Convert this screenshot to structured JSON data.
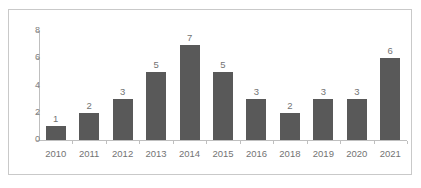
{
  "chart_data": {
    "type": "bar",
    "title": "",
    "subtitle": "",
    "xlabel": "",
    "ylabel": "",
    "categories": [
      "2010",
      "2011",
      "2012",
      "2013",
      "2014",
      "2015",
      "2016",
      "2018",
      "2019",
      "2020",
      "2021"
    ],
    "values": [
      1,
      2,
      3,
      5,
      7,
      5,
      3,
      2,
      3,
      3,
      6
    ],
    "data_labels": [
      "1",
      "2",
      "3",
      "5",
      "7",
      "5",
      "3",
      "2",
      "3",
      "3",
      "6"
    ],
    "ylim": [
      0,
      8
    ],
    "y_ticks": [
      0,
      2,
      4,
      6,
      8
    ],
    "y_tick_labels": [
      "0",
      "2",
      "4",
      "6",
      "8"
    ],
    "grid": false,
    "legend": false,
    "legend_position": "none",
    "bar_color": "#595959",
    "axis_color": "#bfbfbf",
    "label_color": "#737373",
    "frame_color": "#c9c9c9",
    "background_color": "#ffffff",
    "annotations": []
  }
}
